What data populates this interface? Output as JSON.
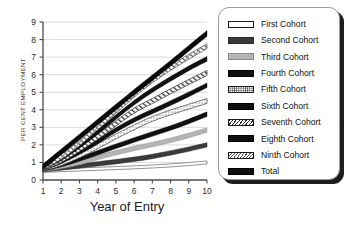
{
  "chart_data": {
    "type": "line",
    "title": "",
    "xlabel": "Year of Entry",
    "ylabel": "PER CENT EMPLOYMENT",
    "x": [
      1,
      2,
      3,
      4,
      5,
      6,
      7,
      8,
      9,
      10
    ],
    "xlim": [
      1,
      10
    ],
    "ylim": [
      0,
      9
    ],
    "xticks": [
      "1",
      "2",
      "3",
      "4",
      "5",
      "6",
      "7",
      "8",
      "9",
      "10"
    ],
    "yticks": [
      "0",
      "1",
      "2",
      "3",
      "4",
      "5",
      "6",
      "7",
      "8",
      "9"
    ],
    "grid": true,
    "legend_position": "right",
    "series": [
      {
        "name": "First Cohort",
        "style": "white-outline",
        "color": "#ffffff",
        "values": [
          0.52,
          0.56,
          0.6,
          0.64,
          0.68,
          0.72,
          0.77,
          0.83,
          0.91,
          1.0
        ]
      },
      {
        "name": "Second Cohort",
        "style": "dark-gray-solid",
        "color": "#3a3a3a",
        "values": [
          0.58,
          0.68,
          0.8,
          0.92,
          1.04,
          1.18,
          1.34,
          1.54,
          1.76,
          2.0
        ]
      },
      {
        "name": "Third Cohort",
        "style": "light-gray-solid",
        "color": "#b5b5b5",
        "values": [
          0.6,
          0.78,
          1.0,
          1.28,
          1.55,
          1.8,
          2.02,
          2.26,
          2.54,
          2.85
        ]
      },
      {
        "name": "Fourth Cohort",
        "style": "black-solid",
        "color": "#101010",
        "values": [
          0.62,
          0.88,
          1.2,
          1.55,
          1.92,
          2.28,
          2.62,
          2.96,
          3.34,
          3.75
        ]
      },
      {
        "name": "Fifth Cohort",
        "style": "dotted",
        "color": "#ffffff",
        "values": [
          0.64,
          0.96,
          1.4,
          1.92,
          2.48,
          3.0,
          3.48,
          3.85,
          4.18,
          4.5
        ]
      },
      {
        "name": "Sixth Cohort",
        "style": "black-solid",
        "color": "#101010",
        "values": [
          0.66,
          1.06,
          1.58,
          2.18,
          2.85,
          3.42,
          3.9,
          4.38,
          4.88,
          5.4
        ]
      },
      {
        "name": "Seventh Cohort",
        "style": "hatched",
        "color": "#ffffff",
        "values": [
          0.68,
          1.14,
          1.76,
          2.46,
          3.22,
          3.95,
          4.5,
          5.05,
          5.58,
          6.1
        ]
      },
      {
        "name": "Eighth Cohort",
        "style": "black-solid",
        "color": "#101010",
        "values": [
          0.7,
          1.24,
          1.94,
          2.74,
          3.58,
          4.4,
          5.12,
          5.76,
          6.36,
          6.9
        ]
      },
      {
        "name": "Ninth Cohort",
        "style": "cross-hatched",
        "color": "#ffffff",
        "values": [
          0.72,
          1.32,
          2.1,
          3.0,
          3.94,
          4.86,
          5.68,
          6.38,
          7.02,
          7.62
        ]
      },
      {
        "name": "Total",
        "style": "black-thick",
        "color": "#0a0a0a",
        "values": [
          0.75,
          1.6,
          2.45,
          3.3,
          4.15,
          5.0,
          5.82,
          6.65,
          7.5,
          8.35
        ]
      }
    ]
  },
  "legend": {
    "items": [
      {
        "label": "First Cohort",
        "swatch": "white-outline"
      },
      {
        "label": "Second Cohort",
        "swatch": "dark-gray-solid"
      },
      {
        "label": "Third Cohort",
        "swatch": "light-gray-solid"
      },
      {
        "label": "Fourth Cohort",
        "swatch": "black-solid"
      },
      {
        "label": "Fifth Cohort",
        "swatch": "dotted"
      },
      {
        "label": "Sixth Cohort",
        "swatch": "black-solid"
      },
      {
        "label": "Seventh Cohort",
        "swatch": "hatched"
      },
      {
        "label": "Eighth Cohort",
        "swatch": "black-solid"
      },
      {
        "label": "Ninth Cohort",
        "swatch": "cross-hatched"
      },
      {
        "label": "Total",
        "swatch": "black-thick"
      }
    ]
  }
}
